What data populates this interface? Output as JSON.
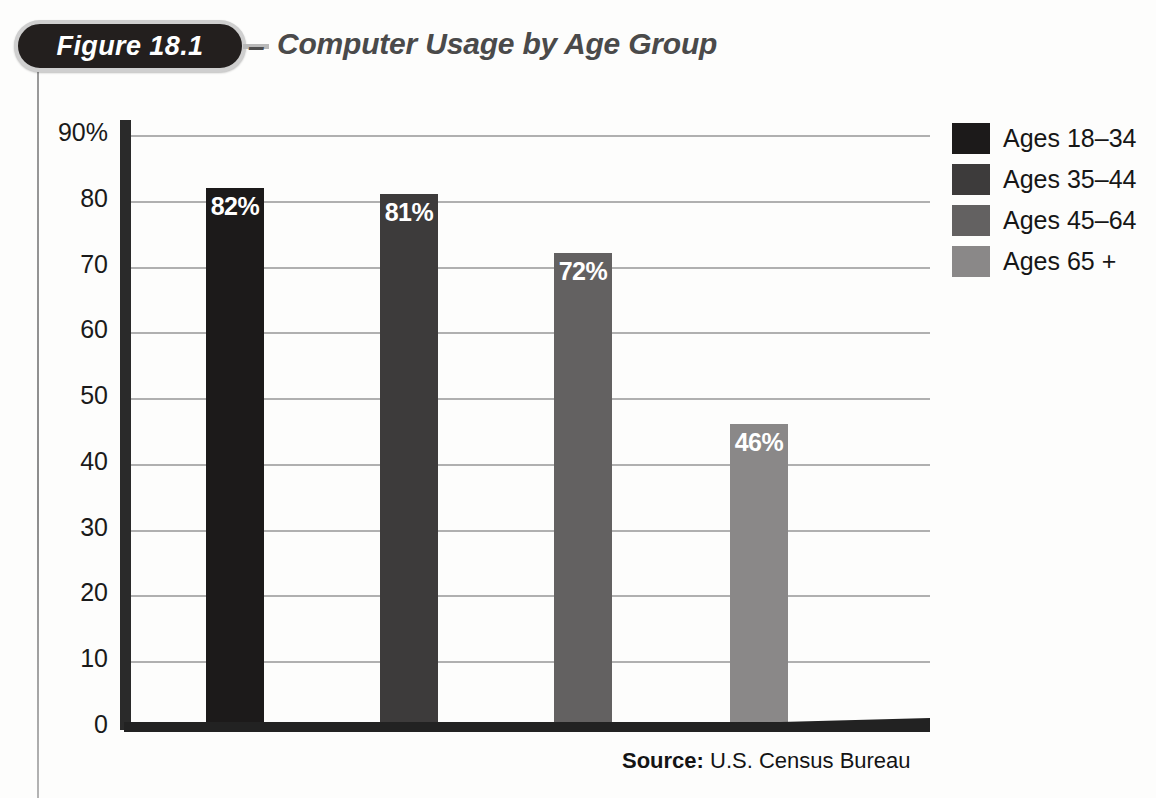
{
  "figure": {
    "badge_label": "Figure 18.1",
    "dash": "–",
    "title": "Computer Usage by Age Group",
    "source_prefix": "Source:",
    "source_text": " U.S. Census Bureau"
  },
  "legend": {
    "items": [
      {
        "label": "Ages 18–34",
        "color": "#1c1a1a"
      },
      {
        "label": "Ages 35–44",
        "color": "#3d3b3b"
      },
      {
        "label": "Ages 45–64",
        "color": "#636161"
      },
      {
        "label": "Ages 65 +",
        "color": "#8a8888"
      }
    ]
  },
  "chart_data": {
    "type": "bar",
    "title": "Computer Usage by Age Group",
    "xlabel": "",
    "ylabel": "",
    "ylim": [
      0,
      90
    ],
    "grid": true,
    "legend_position": "right",
    "y_ticks": [
      90,
      80,
      70,
      60,
      50,
      40,
      30,
      20,
      10,
      0
    ],
    "y_tick_labels": [
      "90%",
      "80",
      "70",
      "60",
      "50",
      "40",
      "30",
      "20",
      "10",
      "0"
    ],
    "categories": [
      "Ages 18–34",
      "Ages 35–44",
      "Ages 45–64",
      "Ages 65 +"
    ],
    "values": [
      82,
      81,
      72,
      46
    ],
    "value_labels": [
      "82%",
      "81%",
      "72%",
      "46%"
    ],
    "colors": [
      "#1c1a1a",
      "#3d3b3b",
      "#636161",
      "#8a8888"
    ],
    "annotation": "Source: U.S. Census Bureau"
  }
}
